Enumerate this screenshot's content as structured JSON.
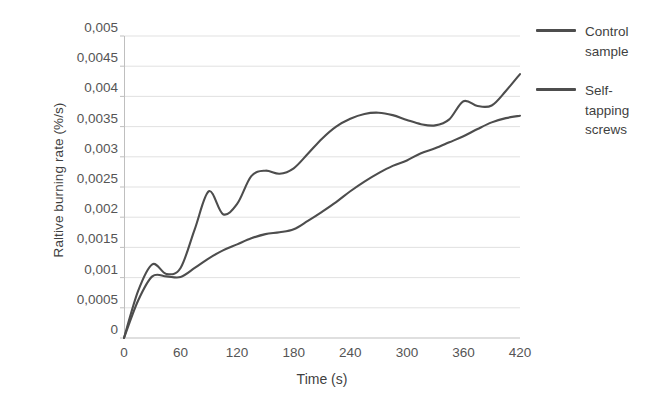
{
  "chart_data": {
    "type": "line",
    "title": "",
    "xlabel": "Time (s)",
    "ylabel": "Raltive burning rate (%/s)",
    "xlim": [
      0,
      420
    ],
    "ylim": [
      0,
      0.005
    ],
    "grid": true,
    "legend_position": "right",
    "x_ticks": [
      0,
      60,
      120,
      180,
      240,
      300,
      360,
      420
    ],
    "x_tick_labels": [
      "0",
      "60",
      "120",
      "180",
      "240",
      "300",
      "360",
      "420"
    ],
    "y_ticks": [
      0,
      0.0005,
      0.001,
      0.0015,
      0.002,
      0.0025,
      0.003,
      0.0035,
      0.004,
      0.0045,
      0.005
    ],
    "y_tick_labels": [
      "0",
      "0,0005",
      "0,001",
      "0,0015",
      "0,002",
      "0,0025",
      "0,003",
      "0,0035",
      "0,004",
      "0,0045",
      "0,005"
    ],
    "x": [
      0,
      15,
      30,
      45,
      60,
      75,
      90,
      105,
      120,
      135,
      150,
      165,
      180,
      195,
      210,
      225,
      240,
      255,
      270,
      285,
      300,
      315,
      330,
      345,
      360,
      375,
      390,
      405,
      420
    ],
    "series": [
      {
        "name": "Control sample",
        "color": "#4d4d4d",
        "values": [
          0,
          0.00078,
          0.00122,
          0.00106,
          0.00116,
          0.0018,
          0.00243,
          0.00205,
          0.00222,
          0.00268,
          0.00277,
          0.00272,
          0.00281,
          0.00305,
          0.0033,
          0.0035,
          0.00363,
          0.00371,
          0.00373,
          0.00369,
          0.00361,
          0.00354,
          0.00352,
          0.00362,
          0.00392,
          0.00384,
          0.00385,
          0.00409,
          0.00437
        ]
      },
      {
        "name": "Self-tapping screws",
        "color": "#4d4d4d",
        "values": [
          0,
          0.00062,
          0.00102,
          0.00102,
          0.00101,
          0.00116,
          0.00132,
          0.00145,
          0.00155,
          0.00165,
          0.00172,
          0.00175,
          0.0018,
          0.00194,
          0.00209,
          0.00225,
          0.00243,
          0.00259,
          0.00273,
          0.00285,
          0.00294,
          0.00306,
          0.00314,
          0.00324,
          0.00334,
          0.00346,
          0.00357,
          0.00364,
          0.00368
        ]
      }
    ]
  },
  "legend": {
    "items": [
      {
        "label": "Control sample",
        "color": "#4d4d4d"
      },
      {
        "label": "Self-tapping screws",
        "color": "#4d4d4d"
      }
    ]
  },
  "style": {
    "grid_color": "#d9d9d9",
    "axis_color": "#bfbfbf",
    "text_color": "#555555",
    "background": "#ffffff"
  }
}
